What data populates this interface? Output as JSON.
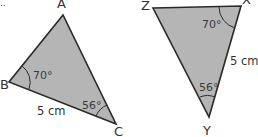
{
  "colors": {
    "fill": "#b5b5b5",
    "stroke": "#2a2a2a",
    "text": "#333333"
  },
  "figure": {
    "ellipsis": "..",
    "triangle1": {
      "vertices": {
        "A": "A",
        "B": "B",
        "C": "C"
      },
      "angle_B": "70°",
      "angle_C": "56°",
      "side_BC": "5 cm"
    },
    "triangle2": {
      "vertices": {
        "Z": "Z",
        "X": "X",
        "Y": "Y"
      },
      "angle_X": "70°",
      "angle_Y": "56°",
      "side_XY": "5 cm"
    }
  }
}
